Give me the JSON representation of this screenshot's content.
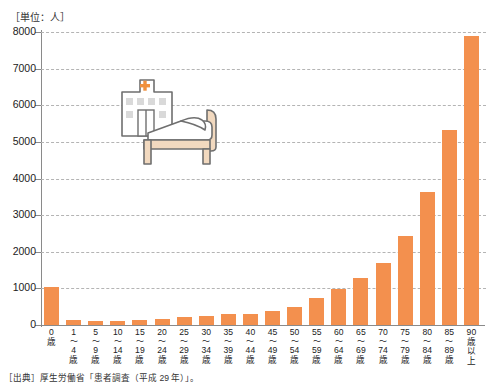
{
  "title_strip": "",
  "unit_caption": "［単位：人］",
  "source_note": "［出典］厚生労働省「患者調査（平成 29 年）」。",
  "colors": {
    "bar": "#f3904e",
    "axis": "#8a8a8a",
    "grid": "#b4b4b4",
    "cross": "#f0913f",
    "bed": "#f2d9bf",
    "outline": "#6f6f6f"
  },
  "illustration": {
    "hospital_icon": "hospital-building-icon",
    "bed_icon": "hospital-bed-icon",
    "cross_icon": "red-cross-icon"
  },
  "chart_data": {
    "type": "bar",
    "title": "",
    "xlabel": "",
    "ylabel": "",
    "unit": "人",
    "ylim": [
      0,
      8000
    ],
    "yticks": [
      0,
      1000,
      2000,
      3000,
      4000,
      5000,
      6000,
      7000,
      8000
    ],
    "ytick_labels": [
      "0",
      "1000",
      "2000",
      "3000",
      "4000",
      "5000",
      "6000",
      "7000",
      "8000"
    ],
    "grid": true,
    "legend": false,
    "categories": [
      "0歳",
      "1〜4歳",
      "5〜9歳",
      "10〜14歳",
      "15〜19歳",
      "20〜24歳",
      "25〜29歳",
      "30〜34歳",
      "35〜39歳",
      "40〜44歳",
      "45〜49歳",
      "50〜54歳",
      "55〜59歳",
      "60〜64歳",
      "65〜69歳",
      "70〜74歳",
      "75〜79歳",
      "80〜84歳",
      "85〜89歳",
      "90歳以上"
    ],
    "category_parts": [
      {
        "from": "0",
        "tilde": "",
        "to": "歳"
      },
      {
        "from": "1",
        "tilde": "〜",
        "to": "4",
        "suffix": "歳"
      },
      {
        "from": "5",
        "tilde": "〜",
        "to": "9",
        "suffix": "歳"
      },
      {
        "from": "10",
        "tilde": "〜",
        "to": "14",
        "suffix": "歳"
      },
      {
        "from": "15",
        "tilde": "〜",
        "to": "19",
        "suffix": "歳"
      },
      {
        "from": "20",
        "tilde": "〜",
        "to": "24",
        "suffix": "歳"
      },
      {
        "from": "25",
        "tilde": "〜",
        "to": "29",
        "suffix": "歳"
      },
      {
        "from": "30",
        "tilde": "〜",
        "to": "34",
        "suffix": "歳"
      },
      {
        "from": "35",
        "tilde": "〜",
        "to": "39",
        "suffix": "歳"
      },
      {
        "from": "40",
        "tilde": "〜",
        "to": "44",
        "suffix": "歳"
      },
      {
        "from": "45",
        "tilde": "〜",
        "to": "49",
        "suffix": "歳"
      },
      {
        "from": "50",
        "tilde": "〜",
        "to": "54",
        "suffix": "歳"
      },
      {
        "from": "55",
        "tilde": "〜",
        "to": "59",
        "suffix": "歳"
      },
      {
        "from": "60",
        "tilde": "〜",
        "to": "64",
        "suffix": "歳"
      },
      {
        "from": "65",
        "tilde": "〜",
        "to": "69",
        "suffix": "歳"
      },
      {
        "from": "70",
        "tilde": "〜",
        "to": "74",
        "suffix": "歳"
      },
      {
        "from": "75",
        "tilde": "〜",
        "to": "79",
        "suffix": "歳"
      },
      {
        "from": "80",
        "tilde": "〜",
        "to": "84",
        "suffix": "歳"
      },
      {
        "from": "85",
        "tilde": "〜",
        "to": "89",
        "suffix": "歳"
      },
      {
        "from": "90",
        "tilde": "歳",
        "to": "以",
        "suffix": "上"
      }
    ],
    "values": [
      1030,
      150,
      100,
      110,
      130,
      170,
      230,
      250,
      290,
      300,
      390,
      500,
      740,
      980,
      1280,
      1680,
      2420,
      3620,
      5320,
      7900
    ]
  }
}
